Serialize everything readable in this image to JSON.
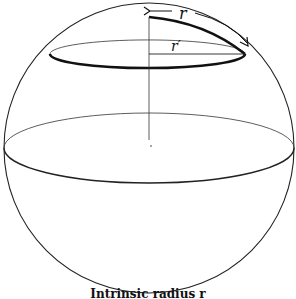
{
  "diagram": {
    "labels": {
      "arc_radius": "r",
      "flat_radius": "r′"
    },
    "caption": "Intrinsic radius r",
    "colors": {
      "stroke": "#222222",
      "background": "#ffffff"
    }
  }
}
